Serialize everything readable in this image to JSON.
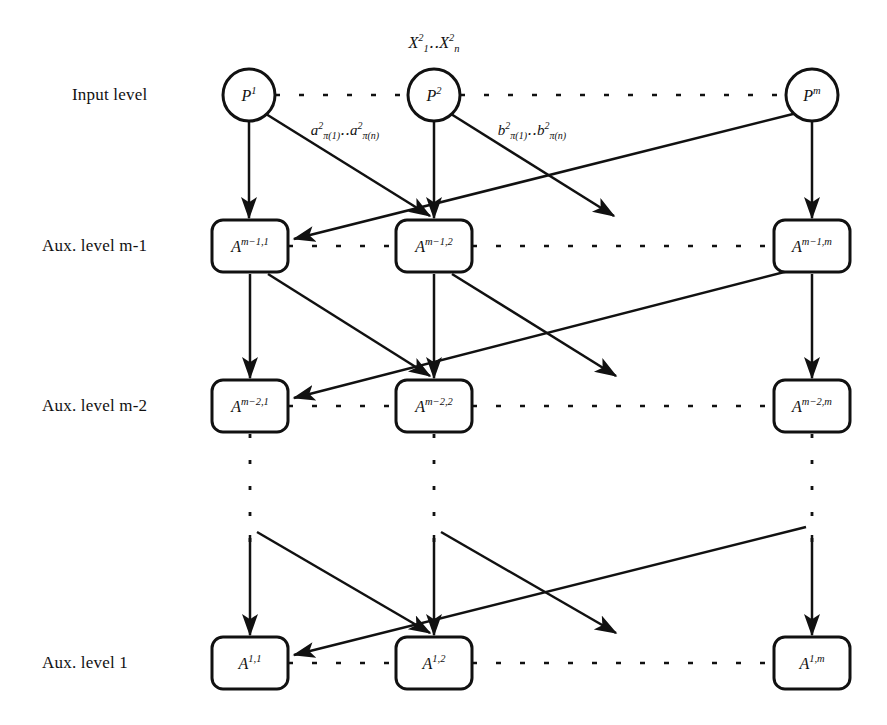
{
  "figure": {
    "background": "#ffffff",
    "ink": "#111111",
    "width": 887,
    "height": 725
  },
  "row_labels": [
    {
      "id": "input-level",
      "text": "Input level",
      "x": 72,
      "y": 95
    },
    {
      "id": "aux-level-m-1",
      "text": "Aux. level m-1",
      "x": 42,
      "y": 246
    },
    {
      "id": "aux-level-m-2",
      "text": "Aux. level m-2",
      "x": 42,
      "y": 406
    },
    {
      "id": "aux-level-1",
      "text": "Aux. level 1",
      "x": 42,
      "y": 663
    }
  ],
  "top_annotation": {
    "id": "x-inputs",
    "text": "X₁²‥Xₙ²",
    "html": "X<sup>2</sup><sub>1</sub>‥X<sup>2</sup><sub>n</sub>",
    "x": 434,
    "y": 43
  },
  "edge_labels": [
    {
      "id": "a-weights",
      "text": "a²_π(1) ‥ a²_π(n)",
      "html": "a<sup>2</sup><sub>&pi;(1)</sub>‥a<sup>2</sup><sub>&pi;(n)</sub>",
      "x": 345,
      "y": 130
    },
    {
      "id": "b-weights",
      "text": "b²_π(1) ‥ b²_π(n)",
      "html": "b<sup>2</sup><sub>&pi;(1)</sub>‥b<sup>2</sup><sub>&pi;(n)</sub>",
      "x": 532,
      "y": 130
    }
  ],
  "levels": [
    {
      "id": "input-level",
      "shape": "circle",
      "y": 95,
      "nodes": [
        {
          "id": "p-1",
          "html": "P<sup>1</sup>",
          "text": "P¹",
          "x": 249,
          "r": 26
        },
        {
          "id": "p-2",
          "html": "P<sup>2</sup>",
          "text": "P²",
          "x": 434,
          "r": 26
        },
        {
          "id": "p-m",
          "html": "P<sup>m</sup>",
          "text": "Pᵐ",
          "x": 812,
          "r": 26
        }
      ]
    },
    {
      "id": "aux-level-m-1",
      "shape": "box",
      "y": 246,
      "nodes": [
        {
          "id": "a-m1-1",
          "html": "A<sup>m&minus;1,1</sup>",
          "text": "A^{m-1,1}",
          "x": 250,
          "w": 76,
          "h": 52
        },
        {
          "id": "a-m1-2",
          "html": "A<sup>m&minus;1,2</sup>",
          "text": "A^{m-1,2}",
          "x": 434,
          "w": 76,
          "h": 52
        },
        {
          "id": "a-m1-m",
          "html": "A<sup>m&minus;1,m</sup>",
          "text": "A^{m-1,m}",
          "x": 812,
          "w": 76,
          "h": 52
        }
      ]
    },
    {
      "id": "aux-level-m-2",
      "shape": "box",
      "y": 406,
      "nodes": [
        {
          "id": "a-m2-1",
          "html": "A<sup>m&minus;2,1</sup>",
          "text": "A^{m-2,1}",
          "x": 250,
          "w": 76,
          "h": 52
        },
        {
          "id": "a-m2-2",
          "html": "A<sup>m&minus;2,2</sup>",
          "text": "A^{m-2,2}",
          "x": 434,
          "w": 76,
          "h": 52
        },
        {
          "id": "a-m2-m",
          "html": "A<sup>m&minus;2,m</sup>",
          "text": "A^{m-2,m}",
          "x": 812,
          "w": 76,
          "h": 52
        }
      ]
    },
    {
      "id": "aux-level-1",
      "shape": "box",
      "y": 663,
      "nodes": [
        {
          "id": "a-1-1",
          "html": "A<sup>1,1</sup>",
          "text": "A^{1,1}",
          "x": 250,
          "w": 76,
          "h": 52
        },
        {
          "id": "a-1-2",
          "html": "A<sup>1,2</sup>",
          "text": "A^{1,2}",
          "x": 434,
          "w": 76,
          "h": 52
        },
        {
          "id": "a-1-m",
          "html": "A<sup>1,m</sup>",
          "text": "A^{1,m}",
          "x": 812,
          "w": 76,
          "h": 52
        }
      ]
    }
  ],
  "connectors": {
    "horizontal_dashed": [
      {
        "id": "dash-input",
        "y": 95,
        "segments": [
          [
            275,
            408
          ],
          [
            460,
            786
          ]
        ]
      },
      {
        "id": "dash-aux-m-1",
        "y": 246,
        "segments": [
          [
            288,
            396
          ],
          [
            472,
            774
          ]
        ]
      },
      {
        "id": "dash-aux-m-2",
        "y": 406,
        "segments": [
          [
            288,
            396
          ],
          [
            472,
            774
          ]
        ]
      },
      {
        "id": "dash-aux-1",
        "y": 663,
        "segments": [
          [
            288,
            396
          ],
          [
            472,
            774
          ]
        ]
      }
    ],
    "vertical_dotted": [
      {
        "id": "dot-col-1",
        "x": 250,
        "y1": 434,
        "y2": 542
      },
      {
        "id": "dot-col-2",
        "x": 434,
        "y1": 434,
        "y2": 542
      },
      {
        "id": "dot-col-m",
        "x": 812,
        "y1": 434,
        "y2": 542
      }
    ],
    "arrows_note": "Each column has a straight vertical arrow downward; each node also emits a diagonal arrow to the left-neighbour column of the level below, plus a long diagonal from the rightmost column to the leftmost column of the level below, and a dangling diagonal that ends in open space."
  },
  "legend": {
    "solid_arrow": "directed connection",
    "dashed_line": "elided nodes in the same level",
    "dotted_line": "elided levels"
  }
}
